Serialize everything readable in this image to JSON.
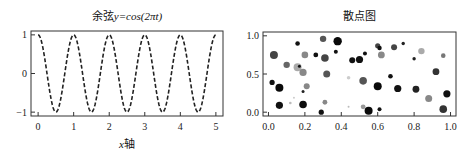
{
  "figure": {
    "background": "#ffffff"
  },
  "chart_data": [
    {
      "type": "line",
      "title": "余弦y=cos(2πt)",
      "title_parts": {
        "prefix": "余弦",
        "formula": "y=cos(2πt)"
      },
      "xlabel": "x轴",
      "xlabel_parts": {
        "var": "x",
        "suffix": "轴"
      },
      "ylabel": "",
      "xlim": [
        -0.2,
        5.2
      ],
      "ylim": [
        -1.1,
        1.1
      ],
      "xticks": [
        0,
        1,
        2,
        3,
        4,
        5
      ],
      "xtick_labels": [
        "0",
        "1",
        "2",
        "3",
        "4",
        "5"
      ],
      "yticks": [
        -1,
        0,
        1
      ],
      "ytick_labels": [
        "−1",
        "0",
        "1"
      ],
      "grid": false,
      "legend": null,
      "series": [
        {
          "name": "cos(2πt)",
          "function": "cos(2*pi*t)",
          "t_range": [
            0,
            5
          ],
          "style": "dashed",
          "color": "#222222",
          "x": [
            0,
            0.25,
            0.5,
            0.75,
            1,
            1.25,
            1.5,
            1.75,
            2,
            2.25,
            2.5,
            2.75,
            3,
            3.25,
            3.5,
            3.75,
            4,
            4.25,
            4.5,
            4.75,
            5
          ],
          "y": [
            1,
            0,
            -1,
            0,
            1,
            0,
            -1,
            0,
            1,
            0,
            -1,
            0,
            1,
            0,
            -1,
            0,
            1,
            0,
            -1,
            0,
            1
          ]
        }
      ]
    },
    {
      "type": "scatter",
      "title": "散点图",
      "xlabel": "",
      "ylabel": "",
      "xlim": [
        -0.03,
        1.03
      ],
      "ylim": [
        -0.05,
        1.05
      ],
      "xticks": [
        0.0,
        0.2,
        0.4,
        0.6,
        0.8,
        1.0
      ],
      "xtick_labels": [
        "0.0",
        "0.2",
        "0.4",
        "0.6",
        "0.8",
        "1.0"
      ],
      "yticks": [
        0.0,
        0.5,
        1.0
      ],
      "ytick_labels": [
        "0.0",
        "0.5",
        "1.0"
      ],
      "grid": false,
      "legend": null,
      "points": [
        {
          "x": 0.03,
          "y": 0.75,
          "size": 4.0,
          "color": "#444444"
        },
        {
          "x": 0.16,
          "y": 0.9,
          "size": 2.3,
          "color": "#111111"
        },
        {
          "x": 0.1,
          "y": 0.62,
          "size": 3.2,
          "color": "#666666"
        },
        {
          "x": 0.02,
          "y": 0.39,
          "size": 2.6,
          "color": "#111111"
        },
        {
          "x": 0.06,
          "y": 0.32,
          "size": 4.0,
          "color": "#0a0a0a"
        },
        {
          "x": 0.06,
          "y": 0.09,
          "size": 3.6,
          "color": "#111111"
        },
        {
          "x": 0.16,
          "y": 0.59,
          "size": 4.0,
          "color": "#aaaaaa"
        },
        {
          "x": 0.17,
          "y": 0.6,
          "size": 1.5,
          "color": "#111111"
        },
        {
          "x": 0.19,
          "y": 0.52,
          "size": 3.6,
          "color": "#888888"
        },
        {
          "x": 0.2,
          "y": 0.75,
          "size": 3.3,
          "color": "#888888"
        },
        {
          "x": 0.21,
          "y": 0.34,
          "size": 3.0,
          "color": "#888888"
        },
        {
          "x": 0.19,
          "y": 0.27,
          "size": 1.5,
          "color": "#222222"
        },
        {
          "x": 0.14,
          "y": 0.19,
          "size": 1.0,
          "color": "#cccccc"
        },
        {
          "x": 0.12,
          "y": 0.12,
          "size": 1.3,
          "color": "#bbbbbb"
        },
        {
          "x": 0.19,
          "y": 0.1,
          "size": 3.8,
          "color": "#0d0d0d"
        },
        {
          "x": 0.26,
          "y": 0.75,
          "size": 2.4,
          "color": "#111111"
        },
        {
          "x": 0.3,
          "y": 0.96,
          "size": 3.2,
          "color": "#555555"
        },
        {
          "x": 0.31,
          "y": 0.71,
          "size": 3.8,
          "color": "#444444"
        },
        {
          "x": 0.32,
          "y": 0.5,
          "size": 3.5,
          "color": "#555555"
        },
        {
          "x": 0.31,
          "y": 0.13,
          "size": 2.4,
          "color": "#888888"
        },
        {
          "x": 0.29,
          "y": 0.0,
          "size": 2.6,
          "color": "#111111"
        },
        {
          "x": 0.38,
          "y": 0.93,
          "size": 4.2,
          "color": "#0a0a0a"
        },
        {
          "x": 0.37,
          "y": 0.79,
          "size": 2.0,
          "color": "#111111"
        },
        {
          "x": 0.46,
          "y": 0.68,
          "size": 3.0,
          "color": "#111111"
        },
        {
          "x": 0.5,
          "y": 0.69,
          "size": 3.6,
          "color": "#111111"
        },
        {
          "x": 0.44,
          "y": 0.45,
          "size": 1.8,
          "color": "#cccccc"
        },
        {
          "x": 0.44,
          "y": 0.07,
          "size": 1.0,
          "color": "#bbbbbb"
        },
        {
          "x": 0.52,
          "y": 0.41,
          "size": 3.8,
          "color": "#555555"
        },
        {
          "x": 0.53,
          "y": 0.77,
          "size": 2.0,
          "color": "#111111"
        },
        {
          "x": 0.52,
          "y": 0.07,
          "size": 2.4,
          "color": "#999999"
        },
        {
          "x": 0.55,
          "y": 0.02,
          "size": 4.0,
          "color": "#0a0a0a"
        },
        {
          "x": 0.6,
          "y": 0.87,
          "size": 2.6,
          "color": "#444444"
        },
        {
          "x": 0.61,
          "y": 0.84,
          "size": 2.2,
          "color": "#111111"
        },
        {
          "x": 0.62,
          "y": 0.75,
          "size": 3.4,
          "color": "#888888"
        },
        {
          "x": 0.6,
          "y": 0.34,
          "size": 4.0,
          "color": "#0a0a0a"
        },
        {
          "x": 0.61,
          "y": 0.04,
          "size": 2.0,
          "color": "#111111"
        },
        {
          "x": 0.67,
          "y": 0.47,
          "size": 2.3,
          "color": "#111111"
        },
        {
          "x": 0.69,
          "y": 0.85,
          "size": 3.0,
          "color": "#444444"
        },
        {
          "x": 0.74,
          "y": 0.9,
          "size": 1.7,
          "color": "#222222"
        },
        {
          "x": 0.71,
          "y": 0.31,
          "size": 3.6,
          "color": "#111111"
        },
        {
          "x": 0.8,
          "y": 0.7,
          "size": 1.7,
          "color": "#222222"
        },
        {
          "x": 0.84,
          "y": 0.8,
          "size": 3.2,
          "color": "#aaaaaa"
        },
        {
          "x": 0.81,
          "y": 0.3,
          "size": 3.4,
          "color": "#222222"
        },
        {
          "x": 0.88,
          "y": 0.18,
          "size": 3.5,
          "color": "#888888"
        },
        {
          "x": 0.92,
          "y": 0.53,
          "size": 3.4,
          "color": "#333333"
        },
        {
          "x": 0.96,
          "y": 0.74,
          "size": 2.3,
          "color": "#777777"
        },
        {
          "x": 0.98,
          "y": 0.24,
          "size": 3.6,
          "color": "#111111"
        },
        {
          "x": 0.96,
          "y": 0.04,
          "size": 3.8,
          "color": "#333333"
        }
      ]
    }
  ]
}
